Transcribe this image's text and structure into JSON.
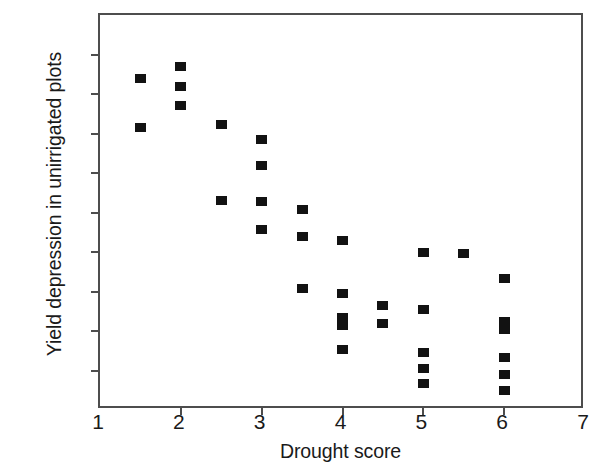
{
  "chart_data": {
    "type": "scatter",
    "title": "",
    "xlabel": "Drought score",
    "ylabel": "Yield depression in unirrigated plots",
    "xlim": [
      1,
      7
    ],
    "ylim": [
      0,
      100
    ],
    "xticks": [
      1,
      2,
      3,
      4,
      5,
      6,
      7
    ],
    "yticks": [
      0,
      10,
      20,
      30,
      40,
      50,
      60,
      70,
      80,
      90,
      100
    ],
    "grid": false,
    "legend": null,
    "marker": "filled-square",
    "marker_color": "#121212",
    "axis_color": "#4d4d4d",
    "background": "#ffffff",
    "points": [
      {
        "x": 1.5,
        "y": 84.0
      },
      {
        "x": 1.5,
        "y": 71.5
      },
      {
        "x": 2.0,
        "y": 87.0
      },
      {
        "x": 2.0,
        "y": 82.0
      },
      {
        "x": 2.0,
        "y": 77.0
      },
      {
        "x": 2.5,
        "y": 72.3
      },
      {
        "x": 2.5,
        "y": 53.0
      },
      {
        "x": 3.0,
        "y": 68.5
      },
      {
        "x": 3.0,
        "y": 62.0
      },
      {
        "x": 3.0,
        "y": 52.8
      },
      {
        "x": 3.0,
        "y": 45.8
      },
      {
        "x": 3.5,
        "y": 50.8
      },
      {
        "x": 3.5,
        "y": 43.8
      },
      {
        "x": 3.5,
        "y": 30.8
      },
      {
        "x": 4.0,
        "y": 43.0
      },
      {
        "x": 4.0,
        "y": 29.5
      },
      {
        "x": 4.0,
        "y": 23.5
      },
      {
        "x": 4.0,
        "y": 21.5
      },
      {
        "x": 4.0,
        "y": 15.3
      },
      {
        "x": 4.5,
        "y": 26.5
      },
      {
        "x": 4.5,
        "y": 22.0
      },
      {
        "x": 5.0,
        "y": 40.0
      },
      {
        "x": 5.0,
        "y": 25.5
      },
      {
        "x": 5.0,
        "y": 14.5
      },
      {
        "x": 5.0,
        "y": 10.5
      },
      {
        "x": 5.0,
        "y": 6.8
      },
      {
        "x": 5.5,
        "y": 39.7
      },
      {
        "x": 6.0,
        "y": 33.3
      },
      {
        "x": 6.0,
        "y": 22.5
      },
      {
        "x": 6.0,
        "y": 20.5
      },
      {
        "x": 6.0,
        "y": 13.3
      },
      {
        "x": 6.0,
        "y": 9.0
      },
      {
        "x": 6.0,
        "y": 5.0
      }
    ]
  }
}
